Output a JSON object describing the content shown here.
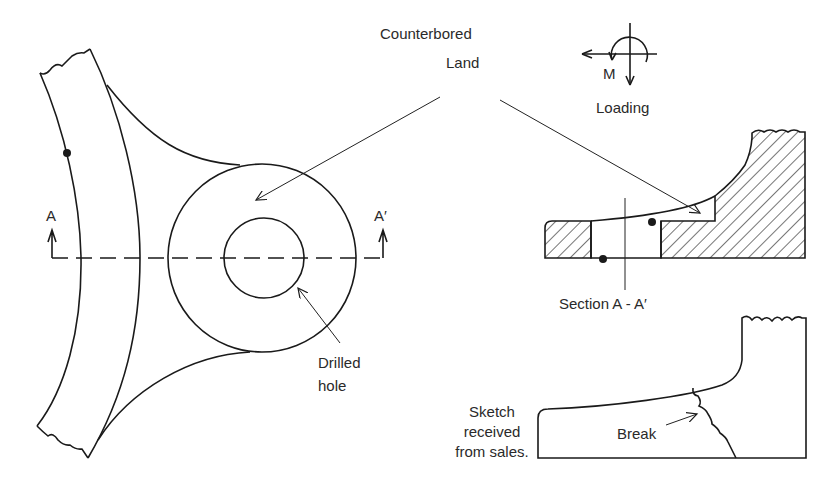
{
  "diagram": {
    "labels": {
      "counterbored": "Counterbored",
      "land": "Land",
      "moment": "M",
      "loading": "Loading",
      "section_a_left": "A",
      "section_a_right": "A′",
      "section_title": "Section A - A′",
      "drilled_line1": "Drilled",
      "drilled_line2": "hole",
      "sketch_line1": "Sketch",
      "sketch_line2": "received",
      "sketch_line3": "from sales.",
      "break": "Break"
    },
    "colors": {
      "line": "#1a1a1a",
      "text": "#2a2a2a",
      "background": "#ffffff"
    }
  }
}
